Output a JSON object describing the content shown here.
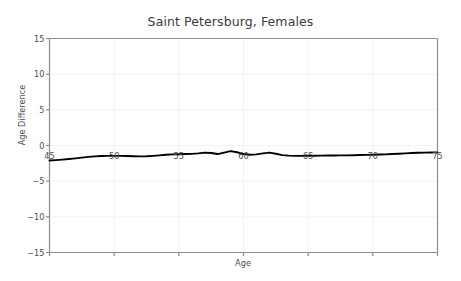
{
  "chart_data": {
    "type": "line",
    "title": "Saint Petersburg, Females",
    "xlabel": "Age",
    "ylabel": "Age Difference",
    "xlim": [
      45,
      75
    ],
    "ylim": [
      -15,
      15
    ],
    "xticks": [
      45,
      50,
      55,
      60,
      65,
      70,
      75
    ],
    "yticks": [
      15,
      10,
      5,
      0,
      -5,
      -10,
      -15
    ],
    "ytick_labels": [
      "15",
      "10",
      "5",
      "0",
      "−5",
      "−10",
      "−15"
    ],
    "xtick_labels": [
      "45",
      "50",
      "55",
      "60",
      "65",
      "70",
      "75"
    ],
    "grid": true,
    "legend": null,
    "line_color": "#000000",
    "grid_color": "#f2f2f2",
    "axis_color": "#8c8c8c",
    "series": [
      {
        "name": "Age Difference",
        "x": [
          45,
          45.5,
          46,
          46.5,
          47,
          47.5,
          48,
          48.5,
          49,
          49.5,
          50,
          50.5,
          51,
          51.5,
          52,
          52.5,
          53,
          53.5,
          54,
          54.5,
          55,
          55.5,
          56,
          56.5,
          57,
          57.5,
          58,
          58.5,
          59,
          59.5,
          60,
          60.5,
          61,
          61.5,
          62,
          62.5,
          63,
          63.5,
          64,
          64.5,
          65,
          65.5,
          66,
          66.5,
          67,
          67.5,
          68,
          68.5,
          69,
          69.5,
          70,
          70.5,
          71,
          71.5,
          72,
          72.5,
          73,
          73.5,
          74,
          74.5,
          75
        ],
        "y": [
          -2.1,
          -2.05,
          -1.98,
          -1.9,
          -1.8,
          -1.7,
          -1.6,
          -1.52,
          -1.48,
          -1.46,
          -1.45,
          -1.46,
          -1.48,
          -1.5,
          -1.52,
          -1.5,
          -1.45,
          -1.38,
          -1.3,
          -1.25,
          -1.22,
          -1.2,
          -1.18,
          -1.1,
          -1.0,
          -1.05,
          -1.2,
          -1.0,
          -0.78,
          -0.95,
          -1.2,
          -1.3,
          -1.25,
          -1.1,
          -1.0,
          -1.15,
          -1.35,
          -1.42,
          -1.45,
          -1.45,
          -1.44,
          -1.43,
          -1.42,
          -1.41,
          -1.4,
          -1.39,
          -1.38,
          -1.36,
          -1.34,
          -1.32,
          -1.3,
          -1.27,
          -1.24,
          -1.2,
          -1.15,
          -1.1,
          -1.05,
          -1.02,
          -1.0,
          -0.98,
          -0.97
        ]
      }
    ]
  },
  "axes": {
    "ylabel_text": "Age Difference",
    "xlabel_text": "Age"
  }
}
